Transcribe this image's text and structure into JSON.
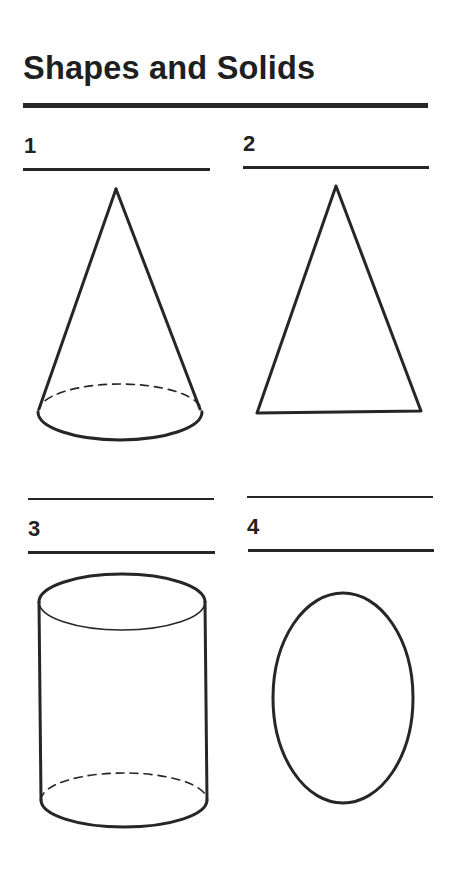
{
  "worksheet": {
    "title": "Shapes and Solids",
    "items": [
      {
        "number": "1",
        "shape": "cone",
        "answer": ""
      },
      {
        "number": "2",
        "shape": "triangle",
        "answer": ""
      },
      {
        "number": "3",
        "shape": "cylinder",
        "answer": ""
      },
      {
        "number": "4",
        "shape": "oval",
        "answer": ""
      }
    ],
    "colors": {
      "ink": "#262626",
      "paper": "#ffffff"
    }
  }
}
